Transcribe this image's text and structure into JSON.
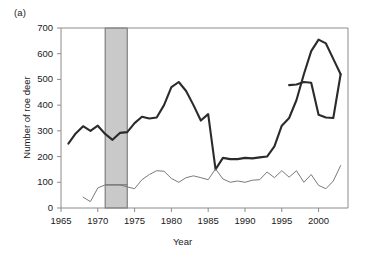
{
  "panel": {
    "label": "(a)"
  },
  "chart_data": {
    "type": "line",
    "title": "",
    "xlabel": "Year",
    "ylabel": "Number of roe deer",
    "xlim": [
      1965,
      2004
    ],
    "ylim": [
      0,
      700
    ],
    "xticks": [
      1965,
      1970,
      1975,
      1980,
      1985,
      1990,
      1995,
      2000
    ],
    "yticks": [
      0,
      100,
      200,
      300,
      400,
      500,
      600,
      700
    ],
    "grid": false,
    "legend": "none",
    "series": [
      {
        "name": "thick-series",
        "style": "thick-dark",
        "color": "#2b2b2b",
        "width": 2.1,
        "x": [
          1966,
          1967,
          1968,
          1969,
          1970,
          1971,
          1972,
          1973,
          1974,
          1975,
          1976,
          1977,
          1978,
          1979,
          1980,
          1981,
          1982,
          1983,
          1984,
          1985,
          1986,
          1987,
          1988,
          1989,
          1990,
          1991,
          1992,
          1993,
          1994,
          1995,
          1996,
          1997,
          1998,
          1999,
          2000,
          2001,
          2002,
          2003
        ],
        "values": [
          250,
          290,
          318,
          300,
          320,
          288,
          265,
          292,
          295,
          330,
          355,
          348,
          352,
          400,
          470,
          490,
          455,
          400,
          340,
          365,
          150,
          195,
          190,
          190,
          195,
          193,
          197,
          200,
          240,
          320,
          350,
          420,
          520,
          610,
          655,
          640,
          580,
          520
        ]
      },
      {
        "name": "thick-series-tail",
        "style": "thick-dark",
        "color": "#2b2b2b",
        "width": 2.1,
        "x": [
          1996,
          1997,
          1998,
          1999,
          2000,
          2001,
          2002,
          2003
        ],
        "values": [
          478,
          480,
          490,
          487,
          363,
          352,
          350,
          520
        ]
      },
      {
        "name": "thin-series",
        "style": "thin-gray",
        "color": "#7a7a7a",
        "width": 1.0,
        "x": [
          1968,
          1969,
          1970,
          1971,
          1972,
          1973,
          1974,
          1975,
          1976,
          1977,
          1978,
          1979,
          1980,
          1981,
          1982,
          1983,
          1984,
          1985,
          1986,
          1987,
          1988,
          1989,
          1990,
          1991,
          1992,
          1993,
          1994,
          1995,
          1996,
          1997,
          1998,
          1999,
          2000,
          2001,
          2002,
          2003
        ],
        "values": [
          42,
          25,
          78,
          90,
          90,
          90,
          82,
          75,
          110,
          130,
          145,
          143,
          115,
          100,
          118,
          125,
          118,
          110,
          152,
          113,
          100,
          105,
          100,
          108,
          110,
          140,
          118,
          145,
          120,
          145,
          100,
          130,
          88,
          75,
          105,
          165
        ]
      }
    ],
    "shaded_band": {
      "name": "highlight-band",
      "x_start": 1971,
      "x_end": 1974,
      "y_start": 0,
      "y_end": 700,
      "fill": "#c9c9c9",
      "stroke": "#6b6b6b"
    },
    "band_marker_line": {
      "name": "band-baseline-marker",
      "x_start": 1971,
      "x_end": 1974,
      "value": 90,
      "color": "#6b6b6b"
    }
  },
  "axis_colors": {
    "axis_line": "#8c8c8c",
    "tick": "#8c8c8c"
  }
}
